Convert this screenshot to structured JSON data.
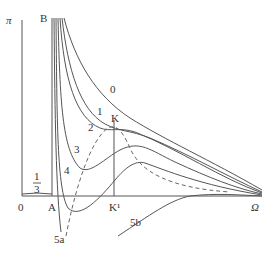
{
  "diagram": {
    "type": "isotherm-diagram",
    "axes": {
      "y_label": "π",
      "x_label": "Ω",
      "origin_label": "0",
      "asymptote_label": "1/3",
      "asymptote_numerator": "1",
      "asymptote_denominator": "3"
    },
    "points": {
      "A": "A",
      "B": "B",
      "K": "K",
      "K1": "K¹"
    },
    "curves": [
      {
        "id": "0",
        "label": "0",
        "style": "solid"
      },
      {
        "id": "1",
        "label": "1",
        "style": "solid"
      },
      {
        "id": "2",
        "label": "2",
        "style": "solid"
      },
      {
        "id": "3",
        "label": "3",
        "style": "solid"
      },
      {
        "id": "4",
        "label": "4",
        "style": "solid"
      },
      {
        "id": "5a",
        "label": "5a",
        "style": "solid"
      },
      {
        "id": "5b",
        "label": "5b",
        "style": "solid"
      },
      {
        "id": "spinodal",
        "label": "",
        "style": "dashed"
      }
    ],
    "colors": {
      "line": "#555555",
      "text": "#333333",
      "background": "#ffffff"
    }
  }
}
